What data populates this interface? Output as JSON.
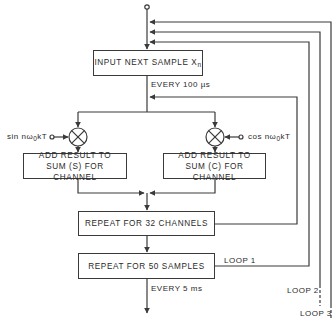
{
  "diagram": {
    "type": "flowchart",
    "boxes": {
      "input": {
        "label": "INPUT NEXT SAMPLE X",
        "sub": "n"
      },
      "add_sin": {
        "line1": "ADD RESULT TO",
        "line2": "SUM (S) FOR CHANNEL"
      },
      "add_cos": {
        "line1": "ADD RESULT TO",
        "line2": "SUM (C) FOR CHANNEL"
      },
      "repeat_channels": {
        "label": "REPEAT FOR 32 CHANNELS"
      },
      "repeat_samples": {
        "label": "REPEAT FOR 50 SAMPLES"
      }
    },
    "inputs": {
      "sin": {
        "pre": "sin nω",
        "sub": "0",
        "post": "kT"
      },
      "cos": {
        "pre": "cos nω",
        "sub": "0",
        "post": "kT"
      }
    },
    "annotations": {
      "every_100us": "EVERY  100 µs",
      "every_5ms": "EVERY  5 ms",
      "loop1": "LOOP 1",
      "loop2": "LOOP 2",
      "loop3": "LOOP 3"
    },
    "colors": {
      "line": "#3a3a3a",
      "background": "#ffffff"
    }
  }
}
